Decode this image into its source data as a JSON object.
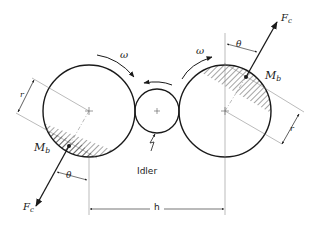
{
  "diagram": {
    "title": "",
    "colors": {
      "ink": "#1a1a1a",
      "thin": "#555555",
      "background": "#ffffff"
    },
    "components": [
      {
        "id": "left-roll",
        "shape": "circle",
        "center": [
          89,
          111
        ],
        "radius": 46
      },
      {
        "id": "idler",
        "shape": "circle",
        "center": [
          157,
          111
        ],
        "radius": 22,
        "label": "Idler"
      },
      {
        "id": "right-roll",
        "shape": "circle",
        "center": [
          225,
          111
        ],
        "radius": 46
      }
    ],
    "labels": {
      "omega_left": "ω",
      "omega_right": "ω",
      "theta_left": "θ",
      "theta_right": "θ",
      "r_left": "r",
      "r_right": "r",
      "mb_left_main": "M",
      "mb_left_sub": "b",
      "mb_right_main": "M",
      "mb_right_sub": "b",
      "fc_left_main": "F",
      "fc_left_sub": "c",
      "fc_right_main": "F",
      "fc_right_sub": "c",
      "idler": "Idler",
      "h": "h"
    }
  }
}
